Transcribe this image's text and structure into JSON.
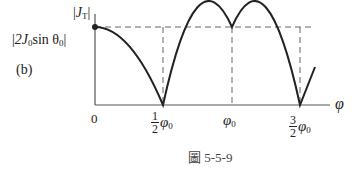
{
  "panel_label": "(b)",
  "y_axis": {
    "label_main": "J",
    "label_sub": "T",
    "peak_label_prefix": "2J",
    "peak_label_sub0": "0",
    "peak_label_mid": "sin θ",
    "peak_label_sub1": "0"
  },
  "x_axis": {
    "label": "φ",
    "origin_label": "0",
    "ticks": [
      {
        "num": "1",
        "den": "2",
        "symbol": "φ",
        "sub": "0"
      },
      {
        "symbol": "φ",
        "sub": "0"
      },
      {
        "num": "3",
        "den": "2",
        "symbol": "φ",
        "sub": "0"
      }
    ]
  },
  "caption": "圖 5-5-9",
  "colors": {
    "curve": "#222222",
    "axis": "#555555",
    "dashed": "#666666"
  }
}
